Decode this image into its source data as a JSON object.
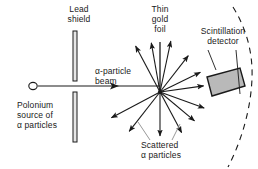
{
  "figure": {
    "type": "diagram",
    "width": 258,
    "height": 169,
    "background_color": "#ffffff",
    "ink_color": "#1a1a1a",
    "detector_fill_color": "#b9b9b9"
  },
  "labels": {
    "lead_shield": {
      "line1": "Lead",
      "line2": "shield"
    },
    "thin_gold_foil": {
      "line1": "Thin",
      "line2": "gold",
      "line3": "foil"
    },
    "scintillation_detector": {
      "line1": "Scintillation",
      "line2": "detector"
    },
    "alpha_beam": {
      "line1": "α-particle",
      "line2": "beam"
    },
    "polonium_source": {
      "line1": "Polonium",
      "line2": "source of",
      "line3": "α particles"
    },
    "scattered_particles": {
      "line1": "Scattered",
      "line2": "α particles"
    }
  },
  "components": {
    "source": {
      "name": "polonium-source",
      "cx": 33,
      "cy": 86,
      "rx": 4.2,
      "ry": 3.6
    },
    "shield_top_bar": {
      "x": 73,
      "y": 31,
      "w": 4,
      "h": 50
    },
    "shield_bottom_bar": {
      "x": 73,
      "y": 92,
      "w": 4,
      "h": 50
    },
    "gold_foil": {
      "x1": 160,
      "y1": 42,
      "x2": 160,
      "y2": 92
    },
    "scatter_point": {
      "x": 160,
      "y": 92
    },
    "detector_box": {
      "points": "207,77 240,68 245,86 212,96",
      "fill": "#b9b9b9"
    },
    "dashed_arc": {
      "description": "dashed detector-travel arc right of foil"
    }
  },
  "beam": {
    "start_x": 38,
    "end_x": 160,
    "y": 86,
    "arrow_at_x": 118
  },
  "scattered_rays": [
    {
      "angle_deg": 118,
      "length": 52,
      "arrow": true
    },
    {
      "angle_deg": 100,
      "length": 50,
      "arrow": true
    },
    {
      "angle_deg": 78,
      "length": 52,
      "arrow": true
    },
    {
      "angle_deg": 52,
      "length": 46,
      "arrow": true
    },
    {
      "angle_deg": 26,
      "length": 45,
      "arrow": true
    },
    {
      "angle_deg": 8,
      "length": 44,
      "arrow": true
    },
    {
      "angle_deg": -20,
      "length": 47,
      "arrow": true
    },
    {
      "angle_deg": -40,
      "length": 45,
      "arrow": true
    },
    {
      "angle_deg": -62,
      "length": 46,
      "arrow": true
    },
    {
      "angle_deg": -90,
      "length": 44,
      "arrow": true
    },
    {
      "angle_deg": -128,
      "length": 50,
      "arrow": true
    },
    {
      "angle_deg": -152,
      "length": 55,
      "arrow": true
    }
  ]
}
